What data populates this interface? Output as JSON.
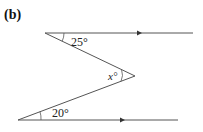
{
  "figure": {
    "part_label": "(b)",
    "top_line": {
      "x1": 45,
      "y1": 33,
      "x2": 193,
      "y2": 33,
      "arrow_x": 142
    },
    "bottom_line": {
      "x1": 18,
      "y1": 120,
      "x2": 178,
      "y2": 120,
      "arrow_x": 125
    },
    "apex": {
      "x": 135,
      "y": 76
    },
    "angles": {
      "top": "25°",
      "apex": "x°",
      "bottom": "20°"
    },
    "colors": {
      "line": "#555555",
      "text": "#222222"
    }
  }
}
